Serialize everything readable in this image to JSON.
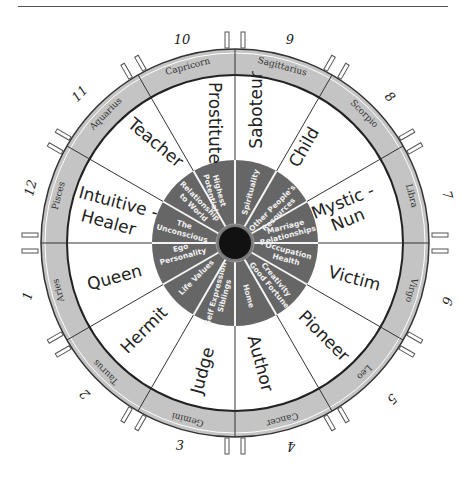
{
  "wheel": {
    "center": [
      235,
      243
    ],
    "colors": {
      "ring_fill": "#c4c4c4",
      "ring_stroke": "#333333",
      "segment_fill": "#ffffff",
      "inner_disc": "#666666",
      "hub": "#111111",
      "divider": "#333333",
      "inner_text": "#f0f0f0"
    },
    "houses": [
      {
        "number": "1",
        "sign": "Aries",
        "archetype": "Queen",
        "house_meaning": "Ego Personality"
      },
      {
        "number": "2",
        "sign": "Taurus",
        "archetype": "Hermit",
        "house_meaning": "Life Values"
      },
      {
        "number": "3",
        "sign": "Gemini",
        "archetype": "Judge",
        "house_meaning": "Self Expression Siblings"
      },
      {
        "number": "4",
        "sign": "Cancer",
        "archetype": "Author",
        "house_meaning": "Home"
      },
      {
        "number": "5",
        "sign": "Leo",
        "archetype": "Pioneer",
        "house_meaning": "Creativity Good Fortune"
      },
      {
        "number": "6",
        "sign": "Virgo",
        "archetype": "Victim",
        "house_meaning": "Occupation Health"
      },
      {
        "number": "7",
        "sign": "Libra",
        "archetype": "Mystic - Nun",
        "house_meaning": "Marriage Relationships"
      },
      {
        "number": "8",
        "sign": "Scorpio",
        "archetype": "Child",
        "house_meaning": "Other People's Resources"
      },
      {
        "number": "9",
        "sign": "Sagittarius",
        "archetype": "Saboteur",
        "house_meaning": "Spirituality"
      },
      {
        "number": "10",
        "sign": "Capricorn",
        "archetype": "Prostitute",
        "house_meaning": "Highest Potential"
      },
      {
        "number": "11",
        "sign": "Aquarius",
        "archetype": "Teacher",
        "house_meaning": "Relationship to World"
      },
      {
        "number": "12",
        "sign": "Pisces",
        "archetype": "Intuitive - Healer",
        "house_meaning": "The Unconscious"
      }
    ],
    "labels": {
      "h1_sign": "Aries",
      "h2_sign": "Taurus",
      "h3_sign": "Gemini",
      "h4_sign": "Cancer",
      "h5_sign": "Leo",
      "h6_sign": "Virgo",
      "h7_sign": "Libra",
      "h8_sign": "Scorpio",
      "h9_sign": "Sagittarius",
      "h10_sign": "Capricorn",
      "h11_sign": "Aquarius",
      "h12_sign": "Pisces",
      "h1_arch": "Queen",
      "h2_arch": "Hermit",
      "h3_arch": "Judge",
      "h4_arch": "Author",
      "h5_arch": "Pioneer",
      "h6_arch": "Victim",
      "h7_arch_a": "Mystic -",
      "h7_arch_b": "Nun",
      "h8_arch": "Child",
      "h9_arch": "Saboteur",
      "h10_arch": "Prostitute",
      "h11_arch": "Teacher",
      "h12_arch_a": "Intuitive -",
      "h12_arch_b": "Healer",
      "h1_in_a": "Ego",
      "h1_in_b": "Personality",
      "h2_in_a": "Life Values",
      "h3_in_a": "Self Expression",
      "h3_in_b": "Siblings",
      "h4_in_a": "Home",
      "h5_in_a": "Creativity",
      "h5_in_b": "Good Fortune",
      "h6_in_a": "Occupation",
      "h6_in_b": "Health",
      "h7_in_a": "Marriage",
      "h7_in_b": "Relationships",
      "h8_in_a": "Other People's",
      "h8_in_b": "Resources",
      "h9_in_a": "Spirituality",
      "h10_in_a": "Highest",
      "h10_in_b": "Potential",
      "h11_in_a": "Relationship",
      "h11_in_b": "to World",
      "h12_in_a": "The",
      "h12_in_b": "Unconscious",
      "n1": "1",
      "n2": "2",
      "n3": "3",
      "n4": "4",
      "n5": "5",
      "n6": "6",
      "n7": "7",
      "n8": "8",
      "n9": "9",
      "n10": "10",
      "n11": "11",
      "n12": "12"
    }
  }
}
